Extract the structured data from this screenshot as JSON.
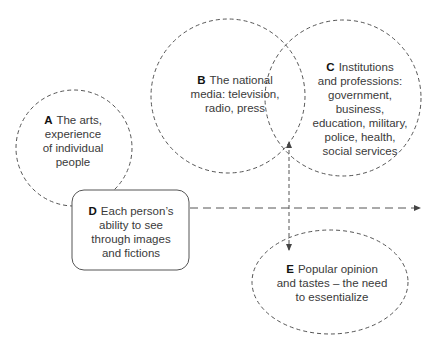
{
  "nodes": {
    "A": {
      "letter": "A",
      "text_line1": "The arts,",
      "text_rest": [
        "experience",
        "of individual",
        "people"
      ],
      "shape": "dashed-circle"
    },
    "B": {
      "letter": "B",
      "text_line1": "The national",
      "text_rest": [
        "media: television,",
        "radio, press"
      ],
      "shape": "dashed-circle"
    },
    "C": {
      "letter": "C",
      "text_line1": "Institutions",
      "text_rest": [
        "and professions:",
        "government,",
        "business,",
        "education, military,",
        "police, health,",
        "social services"
      ],
      "shape": "dashed-circle"
    },
    "D": {
      "letter": "D",
      "text_line1": "Each person’s",
      "text_rest": [
        "ability to see",
        "through images",
        "and fictions"
      ],
      "shape": "rounded-rectangle"
    },
    "E": {
      "letter": "E",
      "text_line1": "Popular opinion",
      "text_rest": [
        "and tastes – the need",
        "to essentialize"
      ],
      "shape": "dashed-ellipse"
    }
  },
  "arrows": [
    {
      "from": "D",
      "direction": "right",
      "style": "dashed"
    },
    {
      "from": "B-C intersection",
      "direction": "up",
      "style": "dashed"
    },
    {
      "from": "B-C intersection",
      "to": "E",
      "direction": "down",
      "style": "dashed"
    }
  ],
  "colors": {
    "stroke": "#555555",
    "text": "#3a3a3a",
    "letter": "#111111"
  }
}
